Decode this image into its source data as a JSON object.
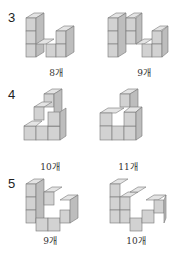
{
  "problems": [
    {
      "number": "3",
      "answers": [
        "8개",
        "9개"
      ]
    },
    {
      "number": "4",
      "answers": [
        "10개",
        "11개"
      ]
    },
    {
      "number": "5",
      "answers": [
        "9개",
        "10개"
      ]
    }
  ],
  "colors": {
    "top": "#e4e4e4",
    "front": "#d2d2d2",
    "side": "#bdbdbd",
    "edge": "#777777"
  }
}
